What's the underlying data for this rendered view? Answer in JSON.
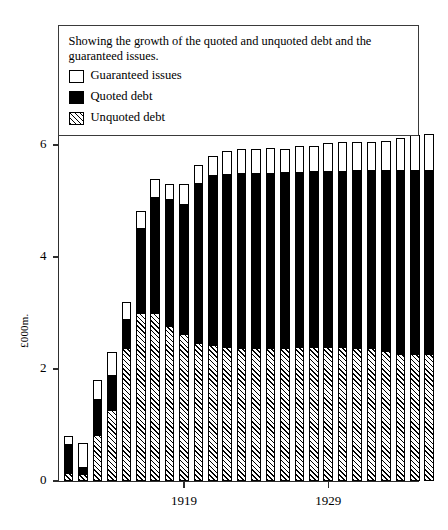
{
  "figure": {
    "ylabel": "£000m.",
    "legend_caption": "Showing the growth of the quoted and unquoted debt and the guaranteed issues.",
    "legend_items": [
      {
        "label": "Guaranteed issues",
        "swatch": "white-square-icon"
      },
      {
        "label": "Quoted debt",
        "swatch": "black-square-icon"
      },
      {
        "label": "Unquoted debt",
        "swatch": "hatched-square-icon"
      }
    ]
  },
  "chart_data": {
    "type": "bar",
    "subtype": "stacked-vertical",
    "title": "Showing the growth of the quoted and unquoted debt and the guaranteed issues.",
    "xlabel": "",
    "ylabel": "£000m.",
    "ylim": [
      0,
      6.6
    ],
    "yticks": [
      0,
      2,
      4,
      6
    ],
    "ytick_labels": [
      "0",
      "2",
      "4",
      "6"
    ],
    "xticks": [
      1919,
      1929
    ],
    "xtick_labels": [
      "1919",
      "1929"
    ],
    "grid": false,
    "legend_position": "upper-left-inside-box",
    "categories": [
      1911,
      1912,
      1913,
      1914,
      1915,
      1916,
      1917,
      1918,
      1919,
      1920,
      1921,
      1922,
      1923,
      1924,
      1925,
      1926,
      1927,
      1928,
      1929,
      1930,
      1931,
      1932,
      1933,
      1934,
      1935,
      1936
    ],
    "series": [
      {
        "name": "Unquoted debt",
        "fill": "hatched",
        "values": [
          0.15,
          0.13,
          0.82,
          1.27,
          2.38,
          3.0,
          3.0,
          2.76,
          2.62,
          2.47,
          2.42,
          2.4,
          2.38,
          2.38,
          2.38,
          2.38,
          2.4,
          2.4,
          2.4,
          2.4,
          2.38,
          2.38,
          2.32,
          2.26,
          2.27,
          2.27
        ]
      },
      {
        "name": "Quoted debt",
        "fill": "black",
        "values": [
          0.5,
          0.1,
          0.62,
          0.6,
          0.5,
          1.5,
          2.06,
          2.25,
          2.31,
          2.84,
          3.03,
          3.07,
          3.1,
          3.1,
          3.1,
          3.12,
          3.1,
          3.12,
          3.12,
          3.12,
          3.16,
          3.16,
          3.22,
          3.28,
          3.27,
          3.27
        ]
      },
      {
        "name": "Guaranteed issues",
        "fill": "white",
        "values": [
          0.15,
          0.45,
          0.36,
          0.43,
          0.32,
          0.32,
          0.34,
          0.3,
          0.38,
          0.34,
          0.35,
          0.43,
          0.44,
          0.44,
          0.46,
          0.42,
          0.48,
          0.47,
          0.52,
          0.53,
          0.51,
          0.52,
          0.54,
          0.58,
          0.63,
          0.65
        ]
      }
    ],
    "totals": [
      0.8,
      0.68,
      1.8,
      2.3,
      3.2,
      4.82,
      5.4,
      5.31,
      5.31,
      5.65,
      5.8,
      5.9,
      5.92,
      5.92,
      5.94,
      5.92,
      5.98,
      5.99,
      6.04,
      6.05,
      6.05,
      6.06,
      6.08,
      6.12,
      6.17,
      6.19
    ]
  }
}
